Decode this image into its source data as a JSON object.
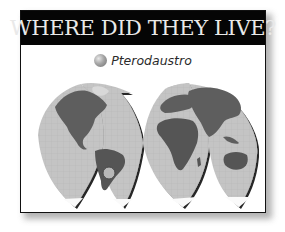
{
  "header": {
    "title": "WHERE DID THEY LIVE?"
  },
  "legend": {
    "items": [
      {
        "icon": "grey-circle-marker-icon",
        "label": "Pterodaustro",
        "color": "#9a9a9a"
      }
    ]
  },
  "map": {
    "projection": "interrupted-goode-homolosine",
    "lobes": 4,
    "highlighted_region": "South America (Argentina)",
    "ocean_color": "#c4c4c4",
    "land_color": "#5e5e5e"
  }
}
